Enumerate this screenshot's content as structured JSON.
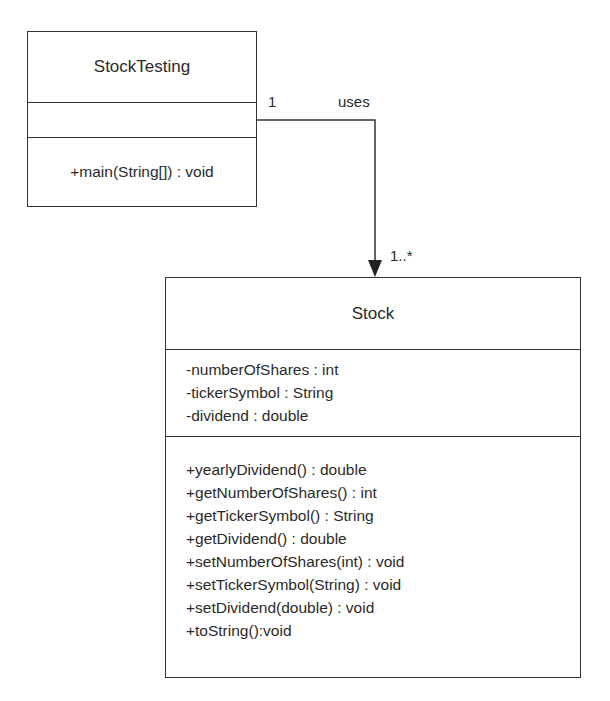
{
  "diagram": {
    "type": "UML class diagram",
    "classes": [
      {
        "name": "StockTesting",
        "attributes": [],
        "operations": [
          "+main(String[]) : void"
        ]
      },
      {
        "name": "Stock",
        "attributes": [
          "-numberOfShares : int",
          "-tickerSymbol : String",
          "-dividend : double"
        ],
        "operations": [
          "+yearlyDividend() : double",
          "+getNumberOfShares() : int",
          "+getTickerSymbol() : String",
          "+getDividend() : double",
          "+setNumberOfShares(int) : void",
          "+setTickerSymbol(String) : void",
          "+setDividend(double) : void",
          "+toString():void"
        ]
      }
    ],
    "association": {
      "label": "uses",
      "source_multiplicity": "1",
      "target_multiplicity": "1..*",
      "from": "StockTesting",
      "to": "Stock"
    }
  }
}
